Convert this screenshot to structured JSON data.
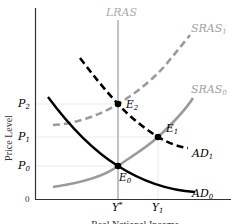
{
  "diagram": {
    "type": "AD-AS model",
    "y_axis_label": "Price Level",
    "x_axis_label": "Real National Income",
    "origin_label": "0",
    "price_levels": [
      {
        "label": "P",
        "sub": "2"
      },
      {
        "label": "P",
        "sub": "1"
      },
      {
        "label": "P",
        "sub": "0"
      }
    ],
    "income_levels": [
      {
        "label": "Y",
        "sup": "*"
      },
      {
        "label": "Y",
        "sub": "1"
      }
    ],
    "curves": {
      "lras": {
        "label": "LRAS",
        "color": "#b0b0b0",
        "style": "solid"
      },
      "sras1": {
        "label": "SRAS",
        "sub": "1",
        "color": "#9a9a9a",
        "style": "dashed"
      },
      "sras0": {
        "label": "SRAS",
        "sub": "0",
        "color": "#9a9a9a",
        "style": "solid"
      },
      "ad1": {
        "label": "AD",
        "sub": "1",
        "color": "#000000",
        "style": "dashed"
      },
      "ad0": {
        "label": "AD",
        "sub": "0",
        "color": "#000000",
        "style": "solid"
      }
    },
    "equilibria": [
      {
        "label": "E",
        "sub": "0"
      },
      {
        "label": "E",
        "sub": "1"
      },
      {
        "label": "E",
        "sub": "2"
      }
    ]
  }
}
